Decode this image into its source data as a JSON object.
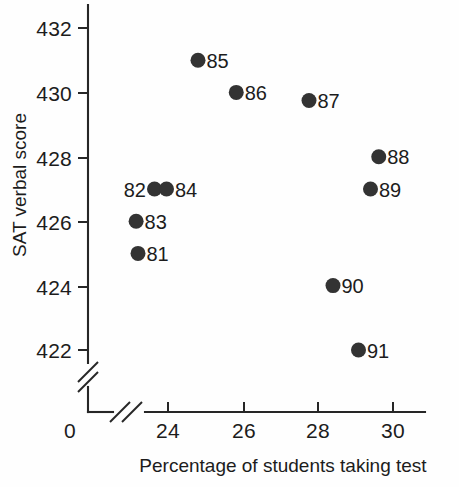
{
  "chart_data": {
    "type": "scatter",
    "title": "",
    "xlabel": "Percentage of students taking test",
    "ylabel": "SAT verbal score",
    "xlim": [
      22.6,
      30.9
    ],
    "ylim": [
      421.3,
      432.7
    ],
    "x_ticks": [
      "0",
      "24",
      "26",
      "28",
      "30"
    ],
    "y_ticks": [
      "432",
      "430",
      "428",
      "426",
      "424",
      "422"
    ],
    "x_axis_break": true,
    "y_axis_break": true,
    "grid": false,
    "legend": "none",
    "point_color": "#333333",
    "axis_color": "#262626",
    "points": [
      {
        "label": "81",
        "x": 23.2,
        "y": 425.0,
        "label_side": "right"
      },
      {
        "label": "82",
        "x": 23.64,
        "y": 427.0,
        "label_side": "left"
      },
      {
        "label": "83",
        "x": 23.15,
        "y": 426.0,
        "label_side": "right"
      },
      {
        "label": "84",
        "x": 23.96,
        "y": 427.0,
        "label_side": "right"
      },
      {
        "label": "85",
        "x": 24.8,
        "y": 431.0,
        "label_side": "right"
      },
      {
        "label": "86",
        "x": 25.82,
        "y": 430.0,
        "label_side": "right"
      },
      {
        "label": "87",
        "x": 27.76,
        "y": 429.75,
        "label_side": "right"
      },
      {
        "label": "88",
        "x": 29.62,
        "y": 428.0,
        "label_side": "right"
      },
      {
        "label": "89",
        "x": 29.4,
        "y": 427.0,
        "label_side": "right"
      },
      {
        "label": "90",
        "x": 28.4,
        "y": 424.0,
        "label_side": "right"
      },
      {
        "label": "91",
        "x": 29.08,
        "y": 422.0,
        "label_side": "right"
      }
    ]
  }
}
